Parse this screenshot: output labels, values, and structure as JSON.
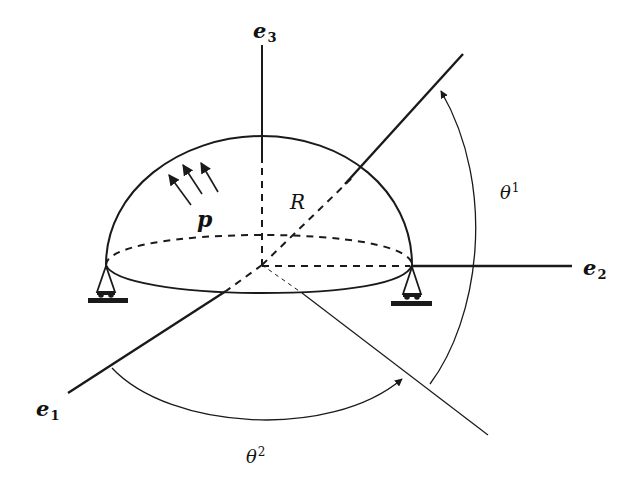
{
  "diagram": {
    "labels": {
      "e1": {
        "base": "e",
        "sub": "1"
      },
      "e2": {
        "base": "e",
        "sub": "2"
      },
      "e3": {
        "base": "e",
        "sub": "3"
      },
      "radius": "R",
      "pressure": "p",
      "theta1": {
        "base": "θ",
        "sup": "1"
      },
      "theta2": {
        "base": "θ",
        "sup": "2"
      }
    },
    "colors": {
      "stroke": "#1a1a1a",
      "background": "#ffffff"
    },
    "elements": {
      "dome": "hemisphere outline",
      "base_ellipse": "dashed back half, solid front half",
      "axes": [
        "e1",
        "e2",
        "e3"
      ],
      "supports": [
        "left-roller-support",
        "right-roller-support"
      ],
      "pressure_arrows": 3,
      "angle_arcs": [
        "theta1",
        "theta2"
      ]
    }
  }
}
